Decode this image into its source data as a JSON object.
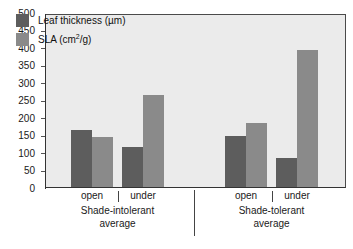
{
  "chart_data": {
    "type": "bar",
    "title": "",
    "xlabel": "",
    "ylabel": "",
    "ylim": [
      0,
      500
    ],
    "y_ticks": [
      0,
      50,
      100,
      150,
      200,
      250,
      300,
      350,
      400,
      450,
      500
    ],
    "grid": false,
    "legend_position": "top-left",
    "categories": [
      "open",
      "under",
      "open",
      "under"
    ],
    "groups": [
      {
        "name": "Shade-intolerant average",
        "line1": "Shade-intolerant",
        "line2": "average",
        "categories": [
          "open",
          "under"
        ]
      },
      {
        "name": "Shade-tolerant average",
        "line1": "Shade-tolerant",
        "line2": "average",
        "categories": [
          "open",
          "under"
        ]
      }
    ],
    "series": [
      {
        "name": "Leaf thickness (µm)",
        "color": "#5d5d5d",
        "values": [
          165,
          117,
          147,
          84
        ]
      },
      {
        "name": "SLA (cm2/g)",
        "color": "#8a8a8a",
        "values": [
          145,
          265,
          185,
          395
        ]
      }
    ]
  },
  "legend": {
    "items": [
      {
        "label_main": "Leaf thickness (µm)",
        "label_pre": "Leaf thickness (µm)",
        "sup": "",
        "label_post": "",
        "swatch": "leaf"
      },
      {
        "label_main": "SLA (cm²/g)",
        "label_pre": "SLA (cm",
        "sup": "2",
        "label_post": "/g)",
        "swatch": "sla"
      }
    ]
  },
  "axis": {
    "y_labels": [
      "500",
      "450",
      "400",
      "350",
      "300",
      "250",
      "200",
      "150",
      "100",
      "50",
      "0"
    ]
  },
  "x_axis": {
    "ticks": [
      "open",
      "under",
      "open",
      "under"
    ]
  },
  "colors": {
    "leaf_thickness": "#5d5d5d",
    "sla": "#8a8a8a",
    "plot_background": "#ebebeb",
    "page_background": "#ffffff",
    "axis": "#333333"
  }
}
